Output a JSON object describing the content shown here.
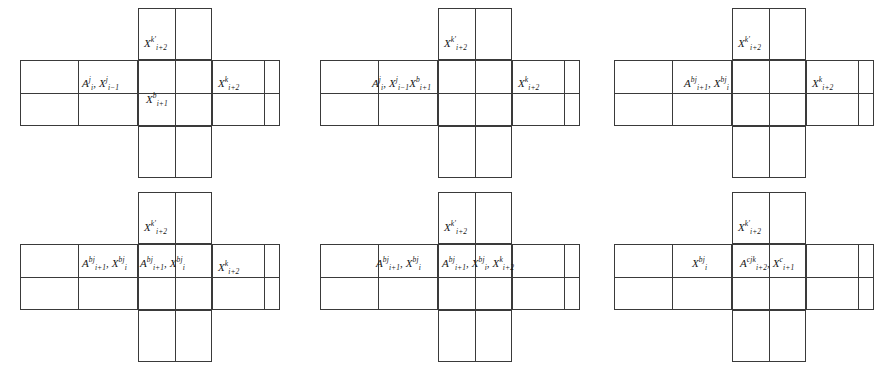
{
  "figure": {
    "type": "cross-tile-diagram-grid",
    "rows": 2,
    "cols": 3,
    "stroke_color": "#3a3a3a",
    "background_color": "#ffffff",
    "panels": [
      {
        "id": "panel-1",
        "position": "top-left",
        "labels": {
          "top_arm": {
            "base": "X",
            "sup": "k'",
            "sub": "i+2",
            "text": "X k' i+2"
          },
          "left_inner": {
            "text": "A j i , X j i-1",
            "parts": [
              {
                "base": "A",
                "sup": "j",
                "sub": "i"
              },
              {
                "base": "X",
                "sup": "j",
                "sub": "i-1"
              }
            ]
          },
          "center": {
            "text": "X b i+1",
            "parts": [
              {
                "base": "X",
                "sup": "b",
                "sub": "i+1"
              }
            ]
          },
          "right_arm": {
            "text": "X k i+2",
            "parts": [
              {
                "base": "X",
                "sup": "k",
                "sub": "i+2"
              }
            ]
          }
        }
      },
      {
        "id": "panel-2",
        "position": "top-middle",
        "labels": {
          "top_arm": {
            "base": "X",
            "sup": "k'",
            "sub": "i+2",
            "text": "X k' i+2"
          },
          "center_span": {
            "text": "A j i , X j i-1 X b i+1",
            "parts": [
              {
                "base": "A",
                "sup": "j",
                "sub": "i"
              },
              {
                "base": "X",
                "sup": "j",
                "sub": "i-1"
              },
              {
                "base": "X",
                "sup": "b",
                "sub": "i+1"
              }
            ]
          },
          "right_arm": {
            "text": "X k i+2",
            "parts": [
              {
                "base": "X",
                "sup": "k",
                "sub": "i+2"
              }
            ]
          }
        }
      },
      {
        "id": "panel-3",
        "position": "top-right",
        "labels": {
          "top_arm": {
            "base": "X",
            "sup": "k'",
            "sub": "i+2",
            "text": "X k' i+2"
          },
          "center_span": {
            "text": "A bj i+1 , X bj i",
            "parts": [
              {
                "base": "A",
                "sup": "bj",
                "sub": "i+1"
              },
              {
                "base": "X",
                "sup": "bj",
                "sub": "i"
              }
            ]
          },
          "right_arm": {
            "text": "X k i+2",
            "parts": [
              {
                "base": "X",
                "sup": "k",
                "sub": "i+2"
              }
            ]
          }
        }
      },
      {
        "id": "panel-4",
        "position": "bottom-left",
        "labels": {
          "top_arm": {
            "base": "X",
            "sup": "k'",
            "sub": "i+2",
            "text": "X k' i+2"
          },
          "left_inner": {
            "text": "A bj i+1 , X bj i",
            "parts": [
              {
                "base": "A",
                "sup": "bj",
                "sub": "i+1"
              },
              {
                "base": "X",
                "sup": "bj",
                "sub": "i"
              }
            ]
          },
          "center": {
            "text": "A bj i+1 , X bj i",
            "parts": [
              {
                "base": "A",
                "sup": "bj",
                "sub": "i+1"
              },
              {
                "base": "X",
                "sup": "bj",
                "sub": "i"
              }
            ]
          },
          "right_arm": {
            "text": "X k i+2",
            "parts": [
              {
                "base": "X",
                "sup": "k",
                "sub": "i+2"
              }
            ]
          }
        }
      },
      {
        "id": "panel-5",
        "position": "bottom-middle",
        "labels": {
          "top_arm": {
            "base": "X",
            "sup": "k'",
            "sub": "i+2",
            "text": "X k' i+2"
          },
          "left_inner": {
            "text": "A bj i+1 , X bj i",
            "parts": [
              {
                "base": "A",
                "sup": "bj",
                "sub": "i+1"
              },
              {
                "base": "X",
                "sup": "bj",
                "sub": "i"
              }
            ]
          },
          "center": {
            "text": "A bj i+1 , X bj i , X k i+2",
            "parts": [
              {
                "base": "A",
                "sup": "bj",
                "sub": "i+1"
              },
              {
                "base": "X",
                "sup": "bj",
                "sub": "i"
              },
              {
                "base": "X",
                "sup": "k",
                "sub": "i+2"
              }
            ]
          }
        }
      },
      {
        "id": "panel-6",
        "position": "bottom-right",
        "labels": {
          "top_arm": {
            "base": "X",
            "sup": "k'",
            "sub": "i+2",
            "text": "X k' i+2"
          },
          "left_inner": {
            "text": "X bj i",
            "parts": [
              {
                "base": "X",
                "sup": "bj",
                "sub": "i"
              }
            ]
          },
          "center": {
            "text": "A cjk i+2 , X c i+1",
            "parts": [
              {
                "base": "A",
                "sup": "cjk",
                "sub": "i+2"
              },
              {
                "base": "X",
                "sup": "c",
                "sub": "i+1"
              }
            ]
          }
        }
      }
    ]
  }
}
